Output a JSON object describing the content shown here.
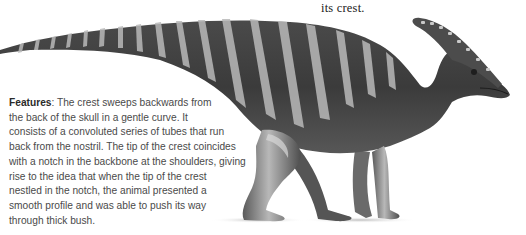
{
  "caption_top": {
    "text": "its crest."
  },
  "illustration": {
    "subject": "parasaurolophus-dinosaur-illustration",
    "colors": {
      "body_dark": "#3a3a3a",
      "body_mid": "#6a6a6a",
      "stripe_light": "#bdbdbd",
      "shadow": "#cfcfcf"
    }
  },
  "features": {
    "term": "Features",
    "separator": ": ",
    "lines": [
      "The crest sweeps backwards from",
      "the back of the skull in a gentle curve. It",
      "consists of a convoluted series of tubes that run",
      "back from the nostril. The tip of the crest coincides",
      "with a notch in the backbone at the shoulders, giving",
      "rise to the idea that when the tip of the crest",
      "nestled in the notch, the animal presented a",
      "smooth profile and was able to push its way",
      "through thick bush."
    ]
  }
}
